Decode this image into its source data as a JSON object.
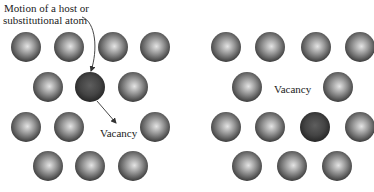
{
  "labels": {
    "motion_line1": "Motion of a host or",
    "motion_line2": "substitutional atom",
    "vacancy_left": "Vacancy",
    "vacancy_right": "Vacancy"
  },
  "colors": {
    "atom_light": "#d8d8d8",
    "atom_mid": "#8a8a8a",
    "atom_dark": "#3e3e3e",
    "moving_atom_light": "#6a6a6a",
    "moving_atom_dark": "#2a2a2a",
    "arrow": "#333333"
  },
  "left_panel": {
    "atoms": [
      {
        "cx": 26,
        "cy": 47,
        "type": "host"
      },
      {
        "cx": 69,
        "cy": 47,
        "type": "host"
      },
      {
        "cx": 113,
        "cy": 47,
        "type": "host"
      },
      {
        "cx": 155,
        "cy": 47,
        "type": "host"
      },
      {
        "cx": 48,
        "cy": 87,
        "type": "host"
      },
      {
        "cx": 90,
        "cy": 87,
        "type": "moving"
      },
      {
        "cx": 133,
        "cy": 87,
        "type": "host"
      },
      {
        "cx": 26,
        "cy": 127,
        "type": "host"
      },
      {
        "cx": 69,
        "cy": 127,
        "type": "host"
      },
      {
        "cx": 155,
        "cy": 127,
        "type": "host"
      },
      {
        "cx": 48,
        "cy": 166,
        "type": "host"
      },
      {
        "cx": 90,
        "cy": 166,
        "type": "host"
      },
      {
        "cx": 133,
        "cy": 166,
        "type": "host"
      }
    ]
  },
  "right_panel": {
    "atoms": [
      {
        "cx": 226,
        "cy": 47,
        "type": "host"
      },
      {
        "cx": 270,
        "cy": 47,
        "type": "host"
      },
      {
        "cx": 316,
        "cy": 47,
        "type": "host"
      },
      {
        "cx": 360,
        "cy": 47,
        "type": "host"
      },
      {
        "cx": 247,
        "cy": 87,
        "type": "host"
      },
      {
        "cx": 338,
        "cy": 87,
        "type": "host"
      },
      {
        "cx": 226,
        "cy": 127,
        "type": "host"
      },
      {
        "cx": 270,
        "cy": 127,
        "type": "host"
      },
      {
        "cx": 315,
        "cy": 127,
        "type": "moving"
      },
      {
        "cx": 360,
        "cy": 127,
        "type": "host"
      },
      {
        "cx": 247,
        "cy": 166,
        "type": "host"
      },
      {
        "cx": 292,
        "cy": 166,
        "type": "host"
      },
      {
        "cx": 337,
        "cy": 166,
        "type": "host"
      }
    ]
  },
  "atom_radius": 15
}
